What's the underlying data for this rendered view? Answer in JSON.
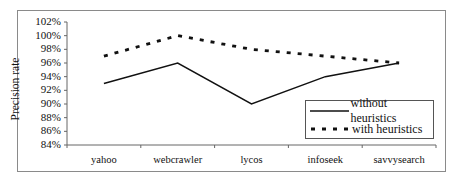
{
  "chart_data": {
    "type": "line",
    "title": "",
    "xlabel": "",
    "ylabel": "Precision rate",
    "categories": [
      "yahoo",
      "webcrawler",
      "lycos",
      "infoseek",
      "savvysearch"
    ],
    "series": [
      {
        "name": "without heuristics",
        "style": "solid",
        "values": [
          93,
          96,
          90,
          94,
          96
        ]
      },
      {
        "name": "with heuristics",
        "style": "dashed",
        "values": [
          97,
          100,
          98,
          97,
          96
        ]
      }
    ],
    "ylim": [
      84,
      102
    ],
    "yticks": [
      "84%",
      "86%",
      "88%",
      "90%",
      "92%",
      "94%",
      "96%",
      "98%",
      "100%",
      "102%"
    ],
    "grid": false,
    "legend_position": "lower right inside plot"
  },
  "legend": {
    "items": [
      "without heuristics",
      "with heuristics"
    ]
  },
  "colors": {
    "line": "#111111",
    "frame": "#8a8a8a"
  }
}
